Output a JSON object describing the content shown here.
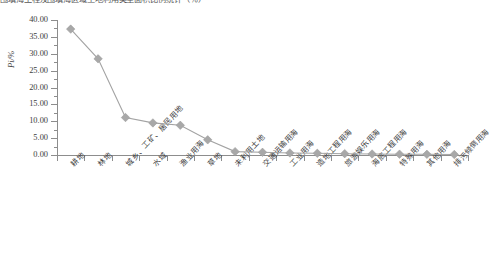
{
  "caption": {
    "text": "围填海工程及围填海区域土地利用类型面积比例统计（％）"
  },
  "chart_data": {
    "type": "line",
    "title": "",
    "xlabel": "",
    "ylabel": "Pi/%",
    "ylim": [
      0,
      40
    ],
    "ytick_step": 5,
    "ytick_labels": [
      "40.00",
      "35.00",
      "30.00",
      "25.00",
      "20.00",
      "15.00",
      "10.00",
      "5.00",
      "0.00"
    ],
    "ytick_values": [
      40,
      35,
      30,
      25,
      20,
      15,
      10,
      5,
      0
    ],
    "grid": false,
    "legend": "none",
    "marker": "diamond",
    "line_color": "#a3a3a3",
    "marker_color": "#a8a8a8",
    "categories": [
      "耕地",
      "林地",
      "城乡、工矿、居民用地",
      "水域",
      "渔业用海",
      "草地",
      "未利用土地",
      "交通运输用海",
      "工业用海",
      "造地工程用海",
      "旅游娱乐用海",
      "海底工程用海",
      "特殊用海",
      "其他用海",
      "排污倾倒用海"
    ],
    "values": [
      37.3,
      28.5,
      11.1,
      9.5,
      8.8,
      4.5,
      1.0,
      0.8,
      0.6,
      0.5,
      0.4,
      0.3,
      0.25,
      0.2,
      0.15
    ]
  }
}
